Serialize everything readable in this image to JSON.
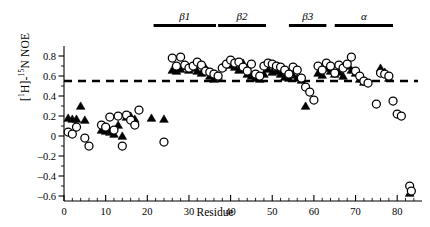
{
  "chart_data": {
    "type": "scatter",
    "title": "",
    "xlabel": "Residue",
    "ylabel": "[1H]-15N NOE",
    "ylabel_parts": {
      "pre": "[",
      "sup1": "1",
      "h": "H]-",
      "sup2": "15",
      "post": "N NOE"
    },
    "xlim": [
      0,
      85
    ],
    "ylim": [
      -0.65,
      0.9
    ],
    "xticks": [
      0,
      10,
      20,
      30,
      40,
      50,
      60,
      70,
      80
    ],
    "yticks": [
      -0.6,
      -0.4,
      -0.2,
      0,
      0.2,
      0.4,
      0.6,
      0.8
    ],
    "ytick_labels": [
      "-0.6",
      "-0.4",
      "-0.2",
      "0",
      "0.2",
      "0.4",
      "0.6",
      "0.8"
    ],
    "xtick_labels": [
      "0",
      "10",
      "20",
      "30",
      "40",
      "50",
      "60",
      "70",
      "80"
    ],
    "minor_tick_interval": 2,
    "grid": false,
    "legend_position": "none",
    "threshold_line": {
      "value": 0.55,
      "style": "dashed",
      "color": "#000000"
    },
    "series": [
      {
        "name": "open-circles",
        "marker": "open-circle",
        "color": "#000000",
        "fill": "#ffffff",
        "points": [
          [
            1,
            0.04
          ],
          [
            2,
            0.02
          ],
          [
            3,
            0.09
          ],
          [
            5,
            -0.02
          ],
          [
            6,
            -0.1
          ],
          [
            9,
            0.11
          ],
          [
            10,
            0.09
          ],
          [
            11,
            0.19
          ],
          [
            12,
            0.06
          ],
          [
            13,
            0.2
          ],
          [
            14,
            -0.1
          ],
          [
            15,
            0.21
          ],
          [
            16,
            0.16
          ],
          [
            17,
            0.11
          ],
          [
            18,
            0.26
          ],
          [
            24,
            -0.06
          ],
          [
            26,
            0.78
          ],
          [
            27,
            0.7
          ],
          [
            28,
            0.79
          ],
          [
            29,
            0.71
          ],
          [
            30,
            0.68
          ],
          [
            31,
            0.7
          ],
          [
            32,
            0.74
          ],
          [
            33,
            0.71
          ],
          [
            34,
            0.65
          ],
          [
            35,
            0.64
          ],
          [
            36,
            0.62
          ],
          [
            37,
            0.6
          ],
          [
            38,
            0.68
          ],
          [
            39,
            0.72
          ],
          [
            40,
            0.76
          ],
          [
            41,
            0.73
          ],
          [
            42,
            0.74
          ],
          [
            43,
            0.69
          ],
          [
            44,
            0.65
          ],
          [
            45,
            0.72
          ],
          [
            46,
            0.62
          ],
          [
            47,
            0.6
          ],
          [
            48,
            0.7
          ],
          [
            49,
            0.73
          ],
          [
            50,
            0.72
          ],
          [
            51,
            0.7
          ],
          [
            52,
            0.69
          ],
          [
            53,
            0.66
          ],
          [
            54,
            0.62
          ],
          [
            55,
            0.69
          ],
          [
            56,
            0.66
          ],
          [
            57,
            0.58
          ],
          [
            58,
            0.49
          ],
          [
            59,
            0.44
          ],
          [
            60,
            0.36
          ],
          [
            61,
            0.7
          ],
          [
            62,
            0.66
          ],
          [
            63,
            0.73
          ],
          [
            64,
            0.7
          ],
          [
            65,
            0.63
          ],
          [
            66,
            0.71
          ],
          [
            67,
            0.68
          ],
          [
            68,
            0.72
          ],
          [
            69,
            0.79
          ],
          [
            70,
            0.65
          ],
          [
            71,
            0.6
          ],
          [
            72,
            0.55
          ],
          [
            73,
            0.53
          ],
          [
            75,
            0.32
          ],
          [
            76,
            0.63
          ],
          [
            77,
            0.62
          ],
          [
            78,
            0.6
          ],
          [
            79,
            0.35
          ],
          [
            80,
            0.22
          ],
          [
            81,
            0.2
          ],
          [
            83,
            -0.5
          ],
          [
            83.4,
            -0.55
          ]
        ]
      },
      {
        "name": "filled-triangles",
        "marker": "filled-triangle",
        "color": "#000000",
        "points": [
          [
            1,
            0.18
          ],
          [
            2,
            0.17
          ],
          [
            3,
            0.17
          ],
          [
            4,
            0.3
          ],
          [
            5,
            0.16
          ],
          [
            9,
            0.06
          ],
          [
            10,
            0.05
          ],
          [
            11,
            0.04
          ],
          [
            12,
            0.02
          ],
          [
            13,
            0.11
          ],
          [
            14,
            0.0
          ],
          [
            15,
            0.19
          ],
          [
            16,
            0.2
          ],
          [
            17,
            0.17
          ],
          [
            21,
            0.18
          ],
          [
            24,
            0.17
          ],
          [
            26,
            0.66
          ],
          [
            27,
            0.65
          ],
          [
            28,
            0.67
          ],
          [
            29,
            0.7
          ],
          [
            30,
            0.66
          ],
          [
            31,
            0.68
          ],
          [
            32,
            0.65
          ],
          [
            33,
            0.63
          ],
          [
            34,
            0.68
          ],
          [
            35,
            0.6
          ],
          [
            36,
            0.57
          ],
          [
            37,
            0.6
          ],
          [
            38,
            0.69
          ],
          [
            39,
            0.72
          ],
          [
            40,
            0.71
          ],
          [
            41,
            0.69
          ],
          [
            42,
            0.66
          ],
          [
            43,
            0.73
          ],
          [
            44,
            0.62
          ],
          [
            45,
            0.6
          ],
          [
            46,
            0.58
          ],
          [
            47,
            0.57
          ],
          [
            48,
            0.62
          ],
          [
            49,
            0.67
          ],
          [
            50,
            0.64
          ],
          [
            51,
            0.65
          ],
          [
            52,
            0.62
          ],
          [
            53,
            0.59
          ],
          [
            54,
            0.58
          ],
          [
            55,
            0.61
          ],
          [
            56,
            0.58
          ],
          [
            57,
            0.56
          ],
          [
            58,
            0.3
          ],
          [
            61,
            0.63
          ],
          [
            62,
            0.61
          ],
          [
            63,
            0.68
          ],
          [
            64,
            0.65
          ],
          [
            65,
            0.62
          ],
          [
            66,
            0.64
          ],
          [
            67,
            0.6
          ],
          [
            68,
            0.7
          ],
          [
            69,
            0.66
          ],
          [
            70,
            0.63
          ],
          [
            71,
            0.57
          ],
          [
            72,
            0.54
          ],
          [
            76,
            0.68
          ],
          [
            77,
            0.64
          ],
          [
            78,
            0.58
          ],
          [
            83,
            -0.57
          ]
        ]
      }
    ],
    "secondary_structure": [
      {
        "label": "b1",
        "display": "β1",
        "start": 21.5,
        "end": 36.5
      },
      {
        "label": "b2",
        "display": "β2",
        "start": 37,
        "end": 48.5
      },
      {
        "label": "b3",
        "display": "β3",
        "start": 54,
        "end": 63
      },
      {
        "label": "alpha",
        "display": "α",
        "start": 65,
        "end": 79
      }
    ]
  }
}
